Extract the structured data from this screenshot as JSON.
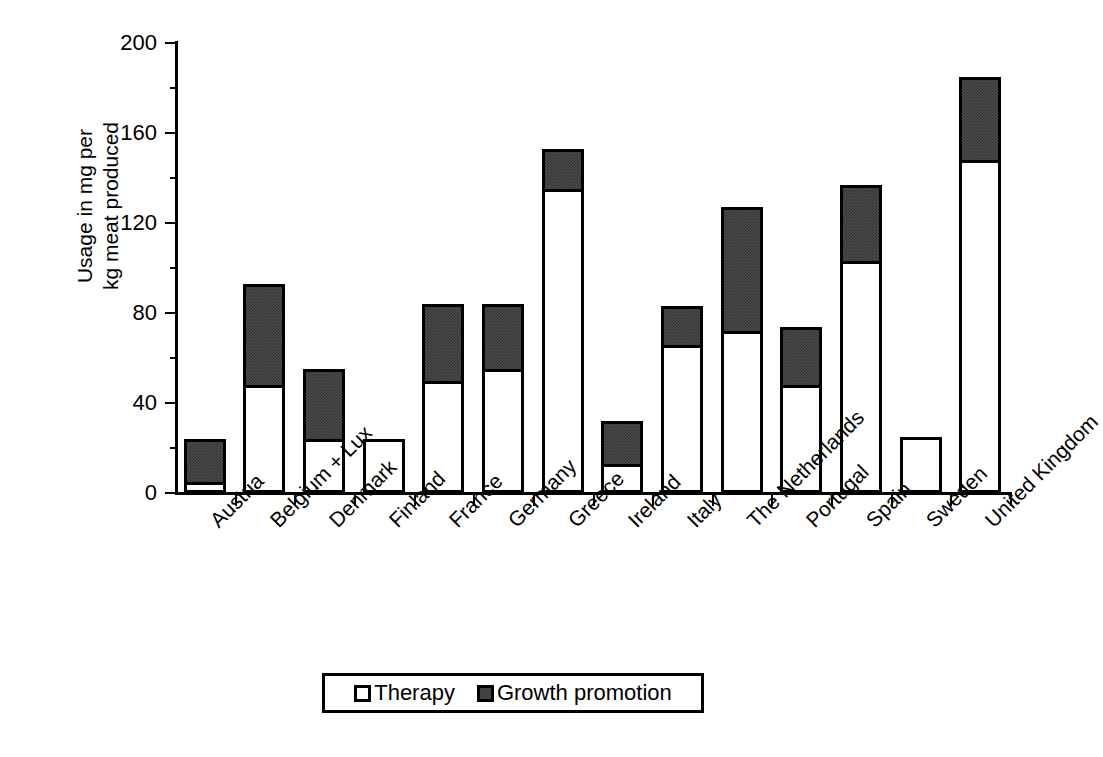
{
  "chart_data": {
    "type": "bar",
    "subtype": "stacked-vertical",
    "title": "",
    "subtitle": "",
    "xlabel": "",
    "ylabel": "Usage in mg per\nkg meat produced",
    "ylim": [
      0,
      200
    ],
    "yticks": [
      0,
      40,
      80,
      120,
      160,
      200
    ],
    "ytick_labels": [
      "0",
      "40",
      "80",
      "120",
      "160",
      "200"
    ],
    "minor_ticks_per_interval": 1,
    "grid": false,
    "legend_position": "bottom-center",
    "categories": [
      "Austria",
      "Belgium + Lux",
      "Denmark",
      "Finland",
      "France",
      "Germany",
      "Greece",
      "Ireland",
      "Italy",
      "The Netherlands",
      "Portugal",
      "Spain",
      "Sweden",
      "United Kingdom"
    ],
    "series": [
      {
        "name": "Therapy",
        "color": "#ffffff",
        "values": [
          5,
          48,
          24,
          24,
          50,
          55,
          135,
          13,
          66,
          72,
          48,
          103,
          25,
          148
        ]
      },
      {
        "name": "Growth promotion",
        "color": "#4d4d4d",
        "values": [
          19,
          45,
          31,
          0,
          34,
          29,
          18,
          19,
          17,
          55,
          26,
          34,
          0,
          37
        ]
      }
    ],
    "totals": [
      24,
      93,
      55,
      24,
      84,
      84,
      153,
      32,
      83,
      127,
      74,
      137,
      25,
      185
    ]
  },
  "legend": {
    "entries": [
      {
        "label": "Therapy",
        "swatch": "hollow-square-swatch"
      },
      {
        "label": "Growth promotion",
        "swatch": "filled-square-swatch"
      }
    ]
  },
  "colors": {
    "axis": "#000000",
    "therapy_fill": "#ffffff",
    "growth_fill": "#4d4d4d",
    "background": "#ffffff"
  }
}
